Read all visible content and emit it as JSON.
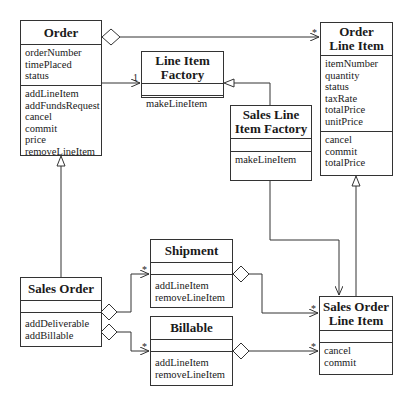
{
  "classes": {
    "order": {
      "title": [
        "Order"
      ],
      "attributes": [
        "orderNumber",
        "timePlaced",
        "status"
      ],
      "methods": [
        "addLineItem",
        "addFundsRequest",
        "cancel",
        "commit",
        "price",
        "removeLineItem"
      ]
    },
    "line_item_factory": {
      "title": [
        "Line Item",
        "Factory"
      ],
      "attributes": [],
      "methods": [
        "makeLineItem"
      ]
    },
    "order_line_item": {
      "title": [
        "Order",
        "Line Item"
      ],
      "attributes": [
        "itemNumber",
        "quantity",
        "status",
        "taxRate",
        "totalPrice",
        "unitPrice"
      ],
      "methods": [
        "cancel",
        "commit",
        "totalPrice"
      ]
    },
    "sales_line_item_factory": {
      "title": [
        "Sales Line",
        "Item Factory"
      ],
      "attributes": [],
      "methods": [
        "makeLineItem"
      ]
    },
    "shipment": {
      "title": [
        "Shipment"
      ],
      "attributes": [],
      "methods": [
        "addLineItem",
        "removeLineItem"
      ]
    },
    "billable": {
      "title": [
        "Billable"
      ],
      "attributes": [],
      "methods": [
        "addLineItem",
        "removeLineItem"
      ]
    },
    "sales_order": {
      "title": [
        "Sales Order"
      ],
      "attributes": [],
      "methods": [
        "addDeliverable",
        "addBillable"
      ]
    },
    "sales_order_line_item": {
      "title": [
        "Sales Order",
        "Line Item"
      ],
      "attributes": [],
      "methods": [
        "cancel",
        "commit"
      ]
    }
  },
  "multiplicities": {
    "order_to_line_item_factory": "1",
    "order_to_order_line_item": "*",
    "sales_order_to_shipment": "*",
    "sales_order_to_billable": "*",
    "shipment_to_sales_order_line_item": "*",
    "billable_to_sales_order_line_item": "*"
  }
}
